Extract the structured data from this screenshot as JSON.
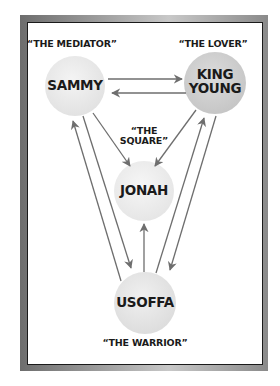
{
  "diagram": {
    "nodes": [
      {
        "id": "sammy",
        "label": "SAMMY",
        "role": "“THE MEDIATOR”",
        "fill": "#ececec"
      },
      {
        "id": "king_young",
        "label": "KING\nYOUNG",
        "role": "“THE LOVER”",
        "fill": "#d4d4d4"
      },
      {
        "id": "jonah",
        "label": "JONAH",
        "role": "“THE\nSQUARE”",
        "fill": "#efefef"
      },
      {
        "id": "usoffa",
        "label": "USOFFA",
        "role": "“THE WARRIOR”",
        "fill": "#e6e6e6"
      }
    ],
    "edges": [
      {
        "from": "sammy",
        "to": "king_young"
      },
      {
        "from": "king_young",
        "to": "sammy"
      },
      {
        "from": "sammy",
        "to": "jonah"
      },
      {
        "from": "king_young",
        "to": "jonah"
      },
      {
        "from": "usoffa",
        "to": "jonah"
      },
      {
        "from": "sammy",
        "to": "usoffa"
      },
      {
        "from": "usoffa",
        "to": "sammy"
      },
      {
        "from": "king_young",
        "to": "usoffa"
      },
      {
        "from": "usoffa",
        "to": "king_young"
      }
    ],
    "colors": {
      "arrow": "#6e6e6e",
      "text": "#1a1a1a",
      "frame_border": "#8a8a8a"
    }
  }
}
